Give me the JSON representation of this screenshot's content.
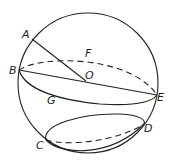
{
  "diagram": {
    "type": "sphere-geometry",
    "stroke_color": "#222222",
    "background": "#ffffff",
    "labels": {
      "A": "A",
      "B": "B",
      "C": "C",
      "D": "D",
      "E": "E",
      "F": "F",
      "G": "G",
      "O": "O"
    },
    "elements": [
      "sphere outline",
      "great circle through B and E (front solid arc G, back dashed arc F)",
      "radius OA",
      "diameter BE through center O",
      "small circle through C and D (front solid, back dashed)"
    ]
  }
}
